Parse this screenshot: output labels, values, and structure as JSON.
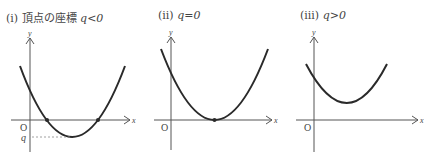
{
  "panels": [
    {
      "id": "i",
      "title": {
        "prefix": "(i)",
        "text": "頂点の座標",
        "condition": "q<0"
      },
      "axis_labels": {
        "x": "x",
        "y": "y",
        "origin": "O",
        "vertex_y": "q"
      }
    },
    {
      "id": "ii",
      "title": {
        "prefix": "(ii)",
        "text": "",
        "condition": "q=0"
      },
      "axis_labels": {
        "x": "x",
        "y": "y",
        "origin": "O"
      }
    },
    {
      "id": "iii",
      "title": {
        "prefix": "(iii)",
        "text": "",
        "condition": "q>0"
      },
      "axis_labels": {
        "x": "x",
        "y": "y",
        "origin": "O"
      }
    }
  ],
  "colors": {
    "curve": "#2a2a2a",
    "axis": "#555555",
    "guide": "#888888"
  }
}
